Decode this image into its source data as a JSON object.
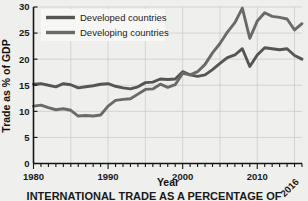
{
  "chart_data": {
    "type": "line",
    "title": "",
    "caption": "INTERNATIONAL TRADE AS A PERCENTAGE OF",
    "xlabel": "Year",
    "ylabel": "Trade as % of GDP",
    "xlim": [
      1980,
      2016
    ],
    "ylim": [
      0,
      30
    ],
    "xticks": [
      1980,
      1990,
      2000,
      2010
    ],
    "xtick_labels": [
      "1980",
      "1990",
      "2000",
      "2010"
    ],
    "xtick_end_label": "2016",
    "yticks": [
      0,
      5,
      10,
      15,
      20,
      25,
      30
    ],
    "ytick_labels": [
      "0",
      "5",
      "10",
      "15",
      "20",
      "25",
      "30"
    ],
    "grid": true,
    "legend_position": "top-left",
    "x": [
      1980,
      1981,
      1982,
      1983,
      1984,
      1985,
      1986,
      1987,
      1988,
      1989,
      1990,
      1991,
      1992,
      1993,
      1994,
      1995,
      1996,
      1997,
      1998,
      1999,
      2000,
      2001,
      2002,
      2003,
      2004,
      2005,
      2006,
      2007,
      2008,
      2009,
      2010,
      2011,
      2012,
      2013,
      2014,
      2015,
      2016
    ],
    "series": [
      {
        "name": "Developed countries",
        "color": "#555553",
        "values": [
          15.2,
          15.3,
          15.0,
          14.7,
          15.3,
          15.1,
          14.5,
          14.7,
          14.9,
          15.2,
          15.3,
          14.8,
          14.5,
          14.3,
          14.7,
          15.5,
          15.6,
          16.2,
          16.1,
          16.2,
          17.6,
          17.0,
          16.7,
          17.0,
          18.0,
          19.2,
          20.3,
          20.8,
          22.0,
          18.6,
          20.8,
          22.2,
          22.0,
          21.8,
          22.0,
          20.7,
          20.0
        ]
      },
      {
        "name": "Developing countries",
        "color": "#6a6a68",
        "values": [
          11.0,
          11.2,
          10.7,
          10.3,
          10.5,
          10.2,
          9.1,
          9.2,
          9.1,
          9.3,
          11.0,
          12.1,
          12.3,
          12.4,
          13.3,
          14.2,
          14.3,
          15.2,
          14.6,
          15.1,
          17.3,
          17.0,
          17.6,
          19.0,
          21.2,
          23.0,
          25.2,
          27.0,
          29.8,
          24.0,
          27.3,
          28.9,
          28.2,
          28.0,
          27.7,
          25.6,
          26.8
        ]
      }
    ]
  }
}
